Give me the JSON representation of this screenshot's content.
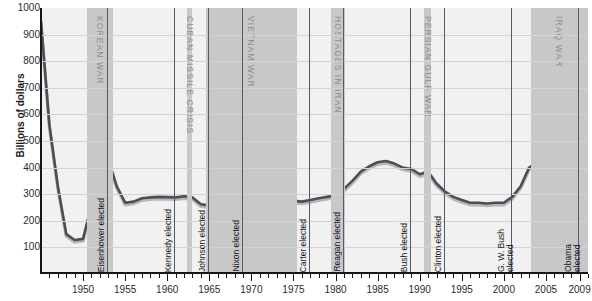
{
  "chart_data": {
    "type": "line",
    "title": "",
    "xlabel": "",
    "ylabel": "Billions of dollars",
    "ylim": [
      0,
      1000
    ],
    "xlim": [
      1945,
      2010
    ],
    "yticks": [
      1000,
      900,
      800,
      700,
      600,
      500,
      400,
      300,
      200,
      100
    ],
    "xticks": [
      1950,
      1955,
      1960,
      1965,
      1970,
      1975,
      1980,
      1985,
      1990,
      1995,
      2000,
      2005,
      2009
    ],
    "grid": true,
    "legend": "none",
    "series": [
      {
        "name": "defense-spending",
        "color": "#4a4f55",
        "x": [
          1945,
          1946,
          1947,
          1948,
          1949,
          1950,
          1951,
          1952,
          1953,
          1954,
          1955,
          1956,
          1957,
          1958,
          1959,
          1960,
          1961,
          1962,
          1963,
          1964,
          1965,
          1966,
          1967,
          1968,
          1969,
          1970,
          1971,
          1972,
          1973,
          1974,
          1975,
          1976,
          1977,
          1978,
          1979,
          1980,
          1981,
          1982,
          1983,
          1984,
          1985,
          1986,
          1987,
          1988,
          1989,
          1990,
          1991,
          1992,
          1993,
          1994,
          1995,
          1996,
          1997,
          1998,
          1999,
          2000,
          2001,
          2002,
          2003,
          2004,
          2005,
          2006,
          2007,
          2008,
          2009
        ],
        "values": [
          950,
          560,
          330,
          150,
          128,
          132,
          260,
          440,
          430,
          330,
          268,
          272,
          285,
          288,
          290,
          289,
          288,
          292,
          288,
          262,
          258,
          300,
          350,
          375,
          380,
          375,
          350,
          330,
          310,
          295,
          275,
          272,
          278,
          285,
          290,
          295,
          320,
          350,
          385,
          405,
          420,
          425,
          415,
          400,
          395,
          375,
          385,
          340,
          310,
          290,
          278,
          268,
          268,
          265,
          268,
          268,
          290,
          330,
          400,
          420,
          410,
          435,
          470,
          560,
          645
        ]
      },
      {
        "name": "defense-spending-shadow",
        "color": "#b4b6b8",
        "x": [
          1945,
          1946,
          1947,
          1948,
          1949,
          1950,
          1951,
          1952,
          1953,
          1954,
          1955,
          1956,
          1957,
          1958,
          1959,
          1960,
          1961,
          1962,
          1963,
          1964,
          1965,
          1966,
          1967,
          1968,
          1969,
          1970,
          1971,
          1972,
          1973,
          1974,
          1975,
          1976,
          1977,
          1978,
          1979,
          1980,
          1981,
          1982,
          1983,
          1984,
          1985,
          1986,
          1987,
          1988,
          1989,
          1990,
          1991,
          1992,
          1993,
          1994,
          1995,
          1996,
          1997,
          1998,
          1999,
          2000,
          2001,
          2002,
          2003,
          2004,
          2005,
          2006,
          2007,
          2008,
          2009
        ],
        "values": [
          940,
          550,
          322,
          142,
          120,
          124,
          252,
          432,
          422,
          322,
          260,
          264,
          277,
          280,
          282,
          281,
          280,
          284,
          280,
          254,
          250,
          292,
          342,
          367,
          372,
          367,
          342,
          322,
          302,
          287,
          267,
          264,
          270,
          277,
          282,
          287,
          312,
          342,
          377,
          397,
          412,
          417,
          407,
          392,
          387,
          367,
          377,
          332,
          302,
          282,
          270,
          260,
          260,
          257,
          260,
          260,
          282,
          322,
          392,
          412,
          402,
          427,
          462,
          552,
          637
        ]
      }
    ],
    "bands": [
      {
        "label": "KOREAN WAR",
        "start": 1950.5,
        "end": 1953.6
      },
      {
        "label": "CUBAN MISSILE CRISIS",
        "start": 1962.4,
        "end": 1962.95
      },
      {
        "label": "VIETNAM WAR",
        "start": 1964.6,
        "end": 1975.4
      },
      {
        "label": "HOSTAGES IN IRAN",
        "start": 1979.5,
        "end": 1981.1
      },
      {
        "label": "PERSIAN GULF WAR",
        "start": 1990.5,
        "end": 1991.4
      },
      {
        "label": "IRAQ WAR",
        "start": 2003.2,
        "end": 2010.0
      }
    ],
    "events": [
      {
        "label": "Eisenhower elected",
        "year": 1952.85
      },
      {
        "label": "Kennedy elected",
        "year": 1960.85
      },
      {
        "label": "Johnson elected",
        "year": 1964.85
      },
      {
        "label": "Nixon elected",
        "year": 1968.85
      },
      {
        "label": "Carter elected",
        "year": 1976.85
      },
      {
        "label": "Reagan elected",
        "year": 1980.85
      },
      {
        "label": "Bush elected",
        "year": 1988.85
      },
      {
        "label": "Clinton elected",
        "year": 1992.85
      },
      {
        "label": "G. W. Bush\nelected",
        "year": 2000.85
      },
      {
        "label": "Obama\nelected",
        "year": 2008.85
      }
    ]
  },
  "colors": {
    "plot_background": "#f1f1f1",
    "band_fill": "#c8c8c8",
    "gridline": "#d2d2d8",
    "line_primary": "#4a4f55",
    "line_shadow": "#b4b6b8",
    "axis": "#15151a",
    "band_text": "#8d8d8d"
  }
}
